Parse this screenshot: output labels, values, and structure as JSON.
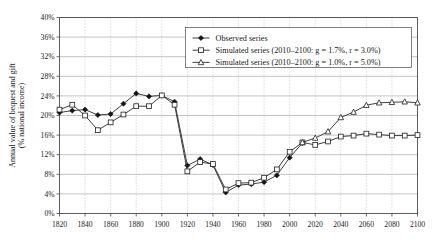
{
  "chart_data": {
    "type": "line",
    "title": "",
    "xlabel": "",
    "ylabel": "Annual value of bequest and gift\n(% national income)",
    "ylabel_line1": "Annual value of bequest and gift",
    "ylabel_line2": "(% national income)",
    "xlim": [
      1820,
      2100
    ],
    "ylim": [
      0,
      40
    ],
    "x_ticks": [
      1820,
      1840,
      1860,
      1880,
      1900,
      1920,
      1940,
      1960,
      1980,
      2000,
      2020,
      2040,
      2060,
      2080,
      2100
    ],
    "x_tick_labels": [
      "1820",
      "1840",
      "1860",
      "1880",
      "1900",
      "1920",
      "1940",
      "1960",
      "1980",
      "2000",
      "2020",
      "2040",
      "2060",
      "2080",
      "2100"
    ],
    "y_ticks": [
      0,
      4,
      8,
      12,
      16,
      20,
      24,
      28,
      32,
      36,
      40
    ],
    "y_tick_labels": [
      "0%",
      "4%",
      "8%",
      "12%",
      "16%",
      "20%",
      "24%",
      "28%",
      "32%",
      "36%",
      "40%"
    ],
    "grid": {
      "horizontal": true,
      "vertical": true,
      "vertical_style": "dotted"
    },
    "legend_position": "top-center",
    "series": [
      {
        "name": "Observed series",
        "marker": "diamond",
        "x": [
          1820,
          1830,
          1840,
          1850,
          1860,
          1870,
          1880,
          1890,
          1900,
          1910,
          1920,
          1930,
          1940,
          1950,
          1960,
          1970,
          1980,
          1990,
          2000,
          2010
        ],
        "values": [
          20.6,
          21.0,
          21.2,
          20.1,
          20.3,
          22.4,
          24.5,
          23.9,
          24.1,
          22.8,
          9.8,
          11.1,
          9.9,
          4.3,
          5.8,
          6.0,
          6.4,
          7.8,
          11.4,
          14.4
        ]
      },
      {
        "name": "Simulated series (2010–2100: g = 1.7%, r = 3.0%)",
        "marker": "square",
        "x": [
          1820,
          1830,
          1840,
          1850,
          1860,
          1870,
          1880,
          1890,
          1900,
          1910,
          1920,
          1930,
          1940,
          1950,
          1960,
          1970,
          1980,
          1990,
          2000,
          2010,
          2020,
          2030,
          2040,
          2050,
          2060,
          2070,
          2080,
          2090,
          2100
        ],
        "values": [
          21.2,
          22.2,
          20.0,
          17.0,
          18.6,
          20.2,
          21.9,
          21.9,
          24.1,
          22.2,
          8.6,
          10.5,
          10.1,
          4.9,
          6.2,
          6.3,
          7.3,
          9.0,
          12.6,
          14.5,
          14.0,
          14.7,
          15.7,
          15.9,
          16.3,
          16.1,
          15.9,
          15.9,
          16.0
        ]
      },
      {
        "name": "Simulated series (2010–2100: g = 1.0%, r = 5.0%)",
        "marker": "triangle",
        "x": [
          2010,
          2020,
          2030,
          2040,
          2050,
          2060,
          2070,
          2080,
          2090,
          2100
        ],
        "values": [
          14.5,
          15.4,
          16.7,
          19.6,
          20.7,
          22.1,
          22.6,
          22.7,
          22.8,
          22.6
        ]
      }
    ]
  },
  "legend": {
    "items": [
      {
        "label": "Observed series",
        "marker": "diamond"
      },
      {
        "label": "Simulated series (2010–2100: g = 1.7%, r = 3.0%)",
        "marker": "square"
      },
      {
        "label": "Simulated series (2010–2100: g = 1.0%, r = 5.0%)",
        "marker": "triangle"
      }
    ]
  }
}
